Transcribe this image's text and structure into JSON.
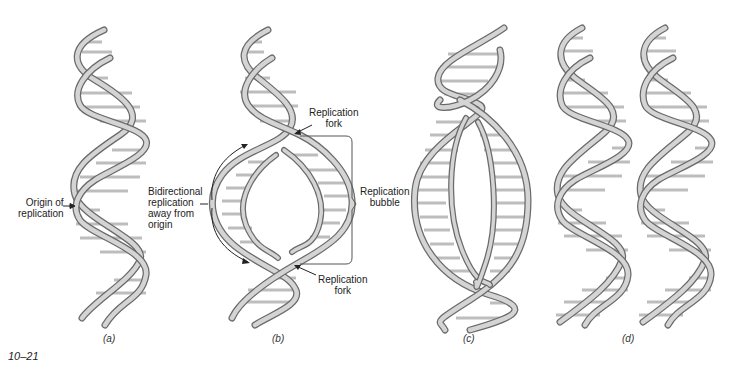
{
  "figure": {
    "number": "10–21",
    "colors": {
      "strand_fill": "#cfcfcf",
      "strand_edge": "#6a6a6a",
      "rung": "#bdbdbd",
      "text": "#222222",
      "background": "#ffffff"
    }
  },
  "panels": [
    {
      "id": "a",
      "label": "(a)",
      "description": "Parental double helix"
    },
    {
      "id": "b",
      "label": "(b)",
      "description": "Replication bubble opening at origin"
    },
    {
      "id": "c",
      "label": "(c)",
      "description": "Enlarged replication bubble"
    },
    {
      "id": "d",
      "label": "(d)",
      "description": "Two daughter double helices"
    }
  ],
  "annotations": {
    "origin": {
      "line1": "Origin of",
      "line2": "replication"
    },
    "bidirectional": {
      "line1": "Bidirectional",
      "line2": "replication",
      "line3": "away from",
      "line4": "origin"
    },
    "fork_top": {
      "line1": "Replication",
      "line2": "fork"
    },
    "bubble": {
      "line1": "Replication",
      "line2": "bubble"
    },
    "fork_bottom": {
      "line1": "Replication",
      "line2": "fork"
    }
  }
}
